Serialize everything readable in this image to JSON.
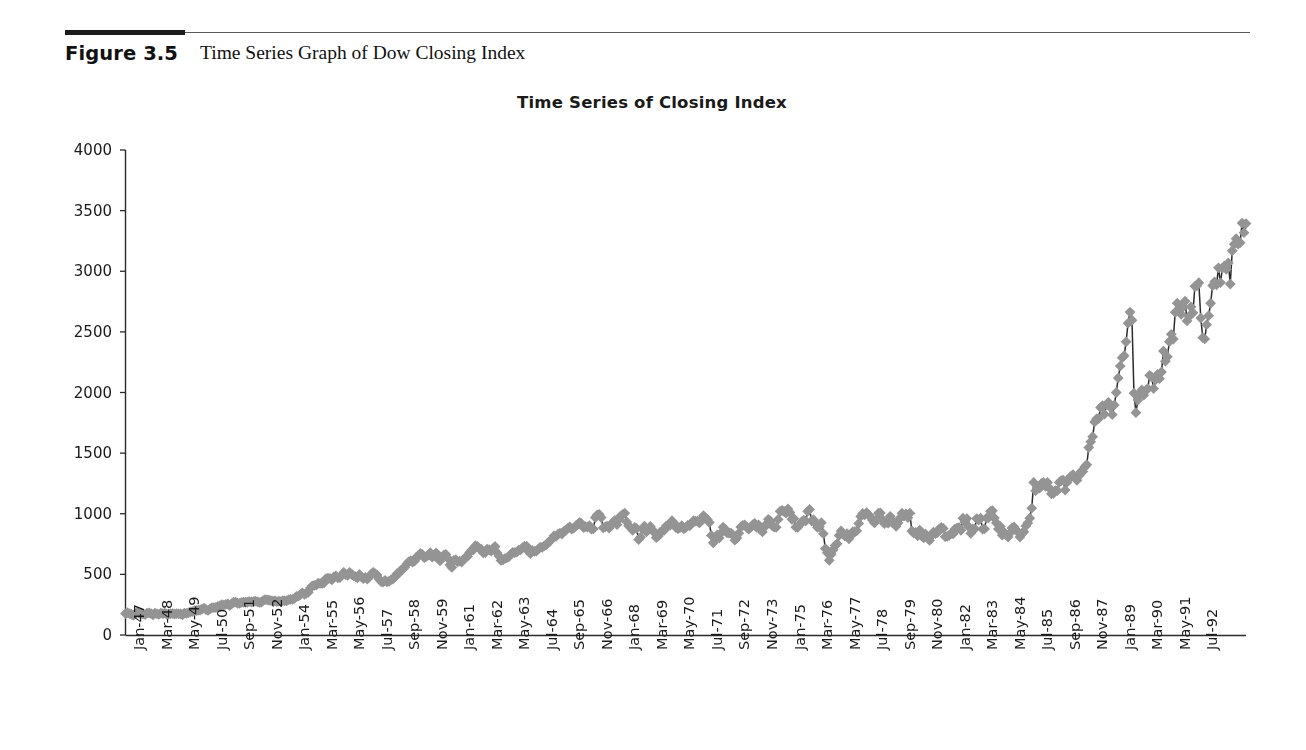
{
  "figure": {
    "number": "Figure 3.5",
    "caption": "Time Series Graph of Dow Closing Index"
  },
  "chart_data": {
    "type": "line",
    "title": "Time Series of Closing Index",
    "xlabel": "",
    "ylabel": "",
    "ylim": [
      0,
      4000
    ],
    "yticks": [
      0,
      500,
      1000,
      1500,
      2000,
      2500,
      3000,
      3500,
      4000
    ],
    "grid": false,
    "legend": null,
    "marker": "diamond",
    "marker_color": "#949494",
    "line_color": "#2b2b2b",
    "x_tick_labels": [
      "Jan-47",
      "Mar-48",
      "May-49",
      "Jul-50",
      "Sep-51",
      "Nov-52",
      "Jan-54",
      "Mar-55",
      "May-56",
      "Jul-57",
      "Sep-58",
      "Nov-59",
      "Jan-61",
      "Mar-62",
      "May-63",
      "Jul-64",
      "Sep-65",
      "Nov-66",
      "Jan-68",
      "Mar-69",
      "May-70",
      "Jul-71",
      "Sep-72",
      "Nov-73",
      "Jan-75",
      "Mar-76",
      "May-77",
      "Jul-78",
      "Sep-79",
      "Nov-80",
      "Jan-82",
      "Mar-83",
      "May-84",
      "Jul-85",
      "Sep-86",
      "Nov-87",
      "Jan-89",
      "Mar-90",
      "May-91",
      "Jul-92"
    ],
    "x_tick_step_months": 14,
    "x_start": "Jan-47",
    "x_end": "Jul-92",
    "n_points": 547,
    "series_name": "Dow Closing Index",
    "values": [
      177,
      184,
      177,
      171,
      163,
      177,
      187,
      179,
      178,
      172,
      169,
      181,
      182,
      176,
      167,
      180,
      175,
      170,
      181,
      176,
      180,
      171,
      173,
      177,
      177,
      173,
      177,
      174,
      175,
      167,
      181,
      178,
      183,
      190,
      192,
      200,
      202,
      203,
      206,
      214,
      222,
      209,
      203,
      216,
      225,
      225,
      227,
      235,
      239,
      251,
      247,
      253,
      257,
      242,
      258,
      270,
      271,
      262,
      261,
      269,
      270,
      270,
      270,
      277,
      272,
      275,
      280,
      275,
      269,
      270,
      284,
      292,
      290,
      287,
      284,
      279,
      281,
      276,
      279,
      275,
      284,
      282,
      281,
      292,
      293,
      294,
      302,
      319,
      320,
      334,
      348,
      336,
      343,
      352,
      387,
      404,
      409,
      412,
      427,
      425,
      425,
      431,
      465,
      468,
      467,
      454,
      480,
      488,
      471,
      474,
      489,
      516,
      501,
      492,
      517,
      502,
      487,
      482,
      472,
      499,
      479,
      465,
      476,
      462,
      478,
      503,
      517,
      505,
      495,
      462,
      441,
      436,
      450,
      439,
      442,
      455,
      462,
      478,
      503,
      508,
      533,
      542,
      557,
      584,
      603,
      612,
      601,
      609,
      643,
      648,
      674,
      664,
      638,
      646,
      659,
      679,
      642,
      652,
      678,
      635,
      611,
      642,
      660,
      664,
      632,
      580,
      557,
      616,
      622,
      604,
      609,
      602,
      624,
      640,
      648,
      680,
      700,
      703,
      736,
      731,
      712,
      708,
      677,
      679,
      709,
      703,
      691,
      714,
      730,
      679,
      652,
      615,
      619,
      630,
      636,
      645,
      667,
      681,
      680,
      684,
      700,
      703,
      721,
      731,
      733,
      690,
      671,
      697,
      689,
      692,
      709,
      724,
      723,
      735,
      743,
      762,
      775,
      793,
      818,
      813,
      831,
      841,
      833,
      855,
      864,
      880,
      892,
      874,
      881,
      900,
      911,
      929,
      918,
      885,
      893,
      890,
      901,
      874,
      875,
      969,
      991,
      995,
      969,
      884,
      892,
      898,
      881,
      911,
      930,
      946,
      910,
      952,
      983,
      995,
      1005,
      932,
      900,
      885,
      864,
      887,
      879,
      786,
      807,
      874,
      898,
      850,
      870,
      895,
      869,
      845,
      803,
      815,
      848,
      856,
      864,
      898,
      906,
      905,
      943,
      923,
      886,
      878,
      884,
      901,
      876,
      886,
      904,
      900,
      924,
      943,
      940,
      939,
      924,
      951,
      984,
      968,
      952,
      928,
      821,
      760,
      800,
      825,
      800,
      842,
      889,
      874,
      842,
      841,
      840,
      825,
      782,
      800,
      839,
      891,
      903,
      908,
      890,
      873,
      888,
      908,
      921,
      888,
      908,
      890,
      850,
      889,
      914,
      954,
      941,
      901,
      890,
      888,
      953,
      1020,
      1027,
      1020,
      1005,
      1040,
      1010,
      954,
      960,
      889,
      888,
      910,
      935,
      947,
      941,
      1020,
      1036,
      942,
      951,
      921,
      887,
      892,
      926,
      836,
      713,
      678,
      616,
      666,
      703,
      739,
      753,
      821,
      858,
      835,
      815,
      836,
      793,
      818,
      852,
      852,
      859,
      920,
      978,
      1002,
      991,
      1009,
      990,
      973,
      947,
      924,
      947,
      1004,
      1007,
      954,
      919,
      930,
      922,
      979,
      930,
      926,
      896,
      924,
      964,
      1004,
      981,
      999,
      968,
      1005,
      858,
      840,
      847,
      818,
      865,
      818,
      801,
      831,
      805,
      780,
      819,
      848,
      836,
      845,
      876,
      887,
      879,
      811,
      814,
      822,
      838,
      835,
      875,
      882,
      886,
      864,
      963,
      932,
      960,
      891,
      839,
      875,
      876,
      960,
      947,
      963,
      874,
      875,
      964,
      967,
      1020,
      1025,
      965,
      924,
      875,
      895,
      823,
      846,
      824,
      808,
      842,
      883,
      891,
      865,
      850,
      808,
      838,
      850,
      900,
      924,
      963,
      1046,
      1258,
      1190,
      1213,
      1211,
      1251,
      1258,
      1226,
      1258,
      1212,
      1165,
      1167,
      1190,
      1190,
      1258,
      1274,
      1277,
      1195,
      1260,
      1292,
      1310,
      1322,
      1301,
      1276,
      1313,
      1347,
      1348,
      1388,
      1404,
      1546,
      1593,
      1636,
      1757,
      1783,
      1784,
      1876,
      1892,
      1821,
      1898,
      1919,
      1877,
      1817,
      1896,
      2000,
      2120,
      2218,
      2286,
      2304,
      2418,
      2572,
      2663,
      2596,
      1994,
      1834,
      1939,
      1990,
      2021,
      1978,
      2015,
      2032,
      2142,
      2129,
      2032,
      2105,
      2149,
      2114,
      2169,
      2342,
      2258,
      2294,
      2419,
      2480,
      2441,
      2661,
      2737,
      2693,
      2645,
      2706,
      2753,
      2590,
      2627,
      2707,
      2657,
      2876,
      2880,
      2905,
      2614,
      2452,
      2442,
      2559,
      2634,
      2736,
      2882,
      2913,
      2888,
      3028,
      2907,
      3025,
      3044,
      3016,
      3069,
      2895,
      3169,
      3223,
      3268,
      3223,
      3235,
      3397,
      3318,
      3393
    ]
  }
}
